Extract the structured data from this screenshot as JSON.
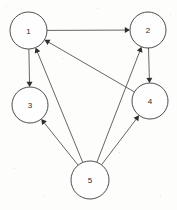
{
  "diagram": {
    "type": "directed-graph",
    "canvas": {
      "width": 177,
      "height": 210,
      "background": "#fdfdfc"
    },
    "style": {
      "node_fill": "#fefefe",
      "node_stroke": "#3a3a3a",
      "edge_color": "#4a4a4a",
      "label_color": "#2a2a2a",
      "arrow_color": "#2e2e2e"
    },
    "nodes": [
      {
        "id": "1",
        "label": "1",
        "cx": 28.5,
        "cy": 30.5,
        "r": 18.5
      },
      {
        "id": "2",
        "label": "2",
        "cx": 148.0,
        "cy": 30.0,
        "r": 18.0
      },
      {
        "id": "3",
        "label": "3",
        "cx": 30.0,
        "cy": 105.0,
        "r": 18.0
      },
      {
        "id": "4",
        "label": "4",
        "cx": 150.0,
        "cy": 101.0,
        "r": 18.0
      },
      {
        "id": "5",
        "label": "5",
        "cx": 90.0,
        "cy": 180.0,
        "r": 19.0
      }
    ],
    "edges": [
      {
        "id": "e1",
        "from": "1",
        "to": "2",
        "directed": true
      },
      {
        "id": "e2",
        "from": "1",
        "to": "3",
        "directed": true
      },
      {
        "id": "e3",
        "from": "2",
        "to": "4",
        "directed": true
      },
      {
        "id": "e4",
        "from": "4",
        "to": "1",
        "directed": true
      },
      {
        "id": "e5",
        "from": "5",
        "to": "1",
        "directed": true
      },
      {
        "id": "e6",
        "from": "5",
        "to": "2",
        "directed": true
      },
      {
        "id": "e7",
        "from": "5",
        "to": "3",
        "directed": true
      },
      {
        "id": "e8",
        "from": "5",
        "to": "4",
        "directed": true
      }
    ]
  },
  "specks": [
    {
      "x": 6,
      "y": 6,
      "s": 1.2
    },
    {
      "x": 170,
      "y": 14,
      "s": 1.0
    },
    {
      "x": 63,
      "y": 58,
      "s": 0.9
    },
    {
      "x": 119,
      "y": 152,
      "s": 1.1
    },
    {
      "x": 14,
      "y": 168,
      "s": 1.0
    },
    {
      "x": 160,
      "y": 196,
      "s": 1.2
    },
    {
      "x": 97,
      "y": 8,
      "s": 0.8
    },
    {
      "x": 44,
      "y": 196,
      "s": 0.9
    }
  ]
}
